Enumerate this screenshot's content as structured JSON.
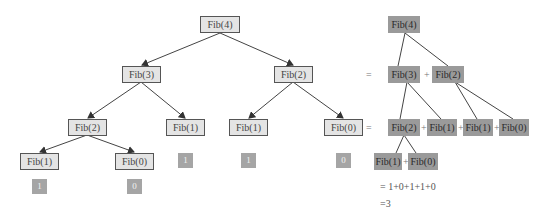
{
  "diagram": {
    "type": "fibonacci-recursion-tree",
    "tree": {
      "root": {
        "id": "t-fib4",
        "label": "Fib(4)"
      },
      "nodes": [
        {
          "id": "t-fib4",
          "label": "Fib(4)",
          "x": 200,
          "y": 16,
          "w": 40
        },
        {
          "id": "t-fib3",
          "label": "Fib(3)",
          "x": 122,
          "y": 66,
          "w": 39
        },
        {
          "id": "t-fib2a",
          "label": "Fib(2)",
          "x": 274,
          "y": 66,
          "w": 39
        },
        {
          "id": "t-fib2b",
          "label": "Fib(2)",
          "x": 68,
          "y": 119,
          "w": 39
        },
        {
          "id": "t-fib1a",
          "label": "Fib(1)",
          "x": 166,
          "y": 119,
          "w": 39
        },
        {
          "id": "t-fib1b",
          "label": "Fib(1)",
          "x": 229,
          "y": 119,
          "w": 39
        },
        {
          "id": "t-fib0a",
          "label": "Fib(0)",
          "x": 324,
          "y": 119,
          "w": 39
        },
        {
          "id": "t-fib1c",
          "label": "Fib(1)",
          "x": 20,
          "y": 153,
          "w": 39
        },
        {
          "id": "t-fib0b",
          "label": "Fib(0)",
          "x": 115,
          "y": 153,
          "w": 39
        }
      ],
      "edges": [
        [
          "t-fib4",
          "t-fib3"
        ],
        [
          "t-fib4",
          "t-fib2a"
        ],
        [
          "t-fib3",
          "t-fib2b"
        ],
        [
          "t-fib3",
          "t-fib1a"
        ],
        [
          "t-fib2a",
          "t-fib1b"
        ],
        [
          "t-fib2a",
          "t-fib0a"
        ],
        [
          "t-fib2b",
          "t-fib1c"
        ],
        [
          "t-fib2b",
          "t-fib0b"
        ]
      ],
      "leaf_values": [
        {
          "node": "t-fib1a",
          "value": "1",
          "x": 178,
          "y": 153
        },
        {
          "node": "t-fib1b",
          "value": "1",
          "x": 241,
          "y": 153
        },
        {
          "node": "t-fib0a",
          "value": "0",
          "x": 336,
          "y": 153
        },
        {
          "node": "t-fib1c",
          "value": "1",
          "x": 32,
          "y": 179
        },
        {
          "node": "t-fib0b",
          "value": "0",
          "x": 127,
          "y": 179
        }
      ]
    },
    "expansion": {
      "rows": [
        {
          "prefix": "",
          "terms": [
            "Fib(4)"
          ]
        },
        {
          "prefix": "=",
          "terms": [
            "Fib(3)",
            "Fib(2)"
          ]
        },
        {
          "prefix": "=",
          "terms": [
            "Fib(2)",
            "Fib(1)",
            "Fib(1)",
            "Fib(0)"
          ]
        },
        {
          "prefix": "",
          "terms": [
            "Fib(1)",
            "Fib(0)"
          ]
        }
      ],
      "operator": "+",
      "sum_line": "= 1+0+1+1+0",
      "result_line": "=3"
    },
    "colors": {
      "tree_node_fill": "#e4e4e4",
      "tree_node_border": "#555555",
      "expansion_node_fill": "#9a9a9a",
      "leaf_value_fill": "#a5a5a5",
      "edge": "#444444"
    }
  }
}
